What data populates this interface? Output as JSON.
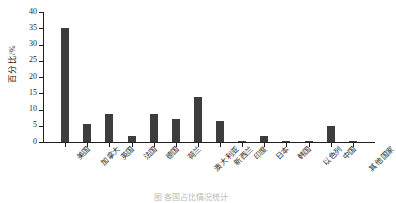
{
  "chart_data": {
    "type": "bar",
    "title": "",
    "xlabel": "",
    "ylabel": "百分比/%",
    "ylim": [
      0,
      40
    ],
    "yticks": [
      0,
      5,
      10,
      15,
      20,
      25,
      30,
      35,
      40
    ],
    "ytick_labels": [
      "0",
      "5",
      "10",
      "15",
      "20",
      "25",
      "30",
      "35",
      "40"
    ],
    "grid": false,
    "legend": null,
    "bar_color": "#3d3d3d",
    "axis_color": "#1f1f1f",
    "categories": [
      "美国",
      "加拿大",
      "英国",
      "法国",
      "德国",
      "荷兰",
      "澳大利亚",
      "新西兰",
      "印度",
      "日本",
      "韩国",
      "以色列",
      "中国",
      "其他国家"
    ],
    "values": [
      35,
      5.5,
      8.5,
      2,
      8.5,
      7,
      14,
      6.5,
      0.2,
      1.7,
      0.2,
      0.4,
      5,
      0.3
    ]
  },
  "caption": {
    "text": "图 各国占比情况统计"
  }
}
